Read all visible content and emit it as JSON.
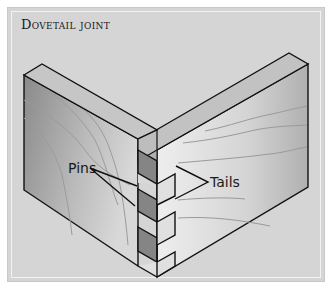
{
  "title": "Dovetail joint",
  "labels": {
    "pins": "Pins",
    "tails": "Tails"
  },
  "colors": {
    "background": "#d5d5d5",
    "board_face_dark": "#8e8e8e",
    "board_face_light": "#e4e4e4",
    "board_top": "#c4c4c4",
    "outline": "#111111"
  }
}
